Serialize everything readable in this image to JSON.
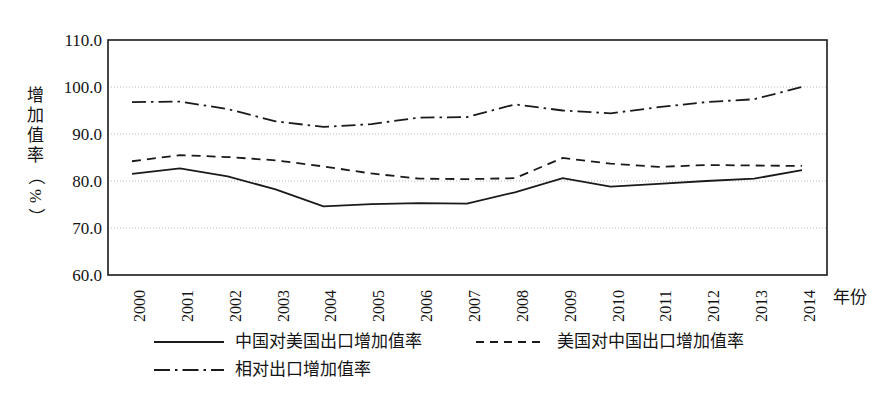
{
  "chart_data": {
    "type": "line",
    "title": "",
    "xlabel": "年份",
    "ylabel": "增加值率（%）",
    "ylabel_chars": [
      "增",
      "加",
      "值",
      "率"
    ],
    "ylabel_rot_chars": [
      "（",
      "%",
      "）"
    ],
    "categories": [
      "2000",
      "2001",
      "2002",
      "2003",
      "2004",
      "2005",
      "2006",
      "2007",
      "2008",
      "2009",
      "2010",
      "2011",
      "2012",
      "2013",
      "2014"
    ],
    "x": [
      2000,
      2001,
      2002,
      2003,
      2004,
      2005,
      2006,
      2007,
      2008,
      2009,
      2010,
      2011,
      2012,
      2013,
      2014
    ],
    "ylim": [
      60.0,
      110.0
    ],
    "yticks": [
      "110.0",
      "100.0",
      "90.0",
      "80.0",
      "70.0",
      "60.0"
    ],
    "ytick_values": [
      110.0,
      100.0,
      90.0,
      80.0,
      70.0,
      60.0
    ],
    "grid": "horizontal-dotted",
    "legend_position": "below-axes",
    "series": [
      {
        "name": "中国对美国出口增加值率",
        "style": "solid",
        "color": "#1a1a1a",
        "values": [
          81.5,
          82.7,
          81.0,
          78.2,
          74.6,
          75.1,
          75.3,
          75.2,
          77.6,
          80.6,
          78.8,
          79.4,
          80.0,
          80.5,
          82.3
        ]
      },
      {
        "name": "美国对中国出口增加值率",
        "style": "dashed",
        "color": "#1a1a1a",
        "values": [
          84.2,
          85.5,
          85.1,
          84.4,
          83.1,
          81.6,
          80.5,
          80.4,
          80.6,
          84.9,
          83.7,
          83.0,
          83.4,
          83.3,
          83.2
        ]
      },
      {
        "name": "相对出口增加值率",
        "style": "dash-dot",
        "color": "#1a1a1a",
        "values": [
          96.8,
          96.9,
          95.3,
          92.7,
          91.5,
          92.1,
          93.5,
          93.6,
          96.3,
          95.0,
          94.4,
          95.7,
          96.8,
          97.4,
          100.0
        ]
      }
    ]
  },
  "legend": {
    "rows": [
      [
        {
          "label": "中国对美国出口增加值率",
          "style": "solid"
        },
        {
          "label": "美国对中国出口增加值率",
          "style": "dashed"
        }
      ],
      [
        {
          "label": "相对出口增加值率",
          "style": "dash-dot"
        }
      ]
    ]
  },
  "axes": {
    "frame_color": "#1a1a1a",
    "grid_color": "#b8b8b8"
  }
}
